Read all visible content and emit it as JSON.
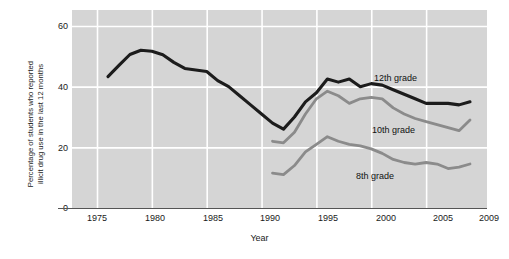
{
  "chart_data": {
    "type": "line",
    "title": "",
    "xlabel": "Year",
    "ylabel_line1": "Percentage of students who reported",
    "ylabel_line2": "illicit drug use in the last 12 months",
    "xlim": [
      1974,
      2010
    ],
    "ylim": [
      0,
      64
    ],
    "grid": true,
    "legend_position": "inline-annotations",
    "xticks": [
      1975,
      1980,
      1985,
      1990,
      1995,
      2000,
      2005,
      2009
    ],
    "xtick_labels": [
      "1975",
      "1980",
      "1985",
      "1990",
      "1995",
      "2000",
      "2005",
      "2009"
    ],
    "yticks": [
      0,
      20,
      40,
      60
    ],
    "ytick_labels": [
      "0",
      "20",
      "40",
      "60"
    ],
    "plot_background": "#d5d5d5",
    "gridline_color": "#ffffff",
    "series": [
      {
        "name": "12th grade",
        "label": "12th grade",
        "color": "#1c1c1c",
        "x": [
          1976,
          1977,
          1978,
          1979,
          1980,
          1981,
          1982,
          1983,
          1984,
          1985,
          1986,
          1987,
          1988,
          1989,
          1990,
          1991,
          1992,
          1993,
          1994,
          1995,
          1996,
          1997,
          1998,
          1999,
          2000,
          2001,
          2002,
          2003,
          2004,
          2005,
          2006,
          2007,
          2008,
          2009
        ],
        "values": [
          43.3,
          47.0,
          50.6,
          52.0,
          51.7,
          50.5,
          48.0,
          46.0,
          45.5,
          45.0,
          42.0,
          40.0,
          37.0,
          34.0,
          31.0,
          28.0,
          26.0,
          30.0,
          35.0,
          38.0,
          42.5,
          41.5,
          42.5,
          40.0,
          41.0,
          40.5,
          39.0,
          37.5,
          36.0,
          34.5,
          34.5,
          34.5,
          34.0,
          35.0
        ],
        "style": "thick-dark"
      },
      {
        "name": "10th grade",
        "label": "10th grade",
        "color": "#8b8b8b",
        "x": [
          1991,
          1992,
          1993,
          1994,
          1995,
          1996,
          1997,
          1998,
          1999,
          2000,
          2001,
          2002,
          2003,
          2004,
          2005,
          2006,
          2007,
          2008,
          2009
        ],
        "values": [
          22.0,
          21.5,
          25.0,
          31.0,
          36.0,
          38.5,
          37.0,
          34.5,
          36.0,
          36.5,
          36.0,
          33.0,
          31.0,
          29.5,
          28.5,
          27.5,
          26.5,
          25.5,
          29.0
        ],
        "style": "thick-gray"
      },
      {
        "name": "8th grade",
        "label": "8th grade",
        "color": "#8b8b8b",
        "x": [
          1991,
          1992,
          1993,
          1994,
          1995,
          1996,
          1997,
          1998,
          1999,
          2000,
          2001,
          2002,
          2003,
          2004,
          2005,
          2006,
          2007,
          2008,
          2009
        ],
        "values": [
          11.5,
          11.0,
          14.0,
          18.5,
          21.0,
          23.5,
          22.0,
          21.0,
          20.5,
          19.5,
          18.0,
          16.0,
          15.0,
          14.5,
          15.0,
          14.5,
          13.0,
          13.5,
          14.5
        ],
        "style": "thick-gray"
      }
    ],
    "annotations": [
      {
        "text": "12th grade",
        "x_px": 374,
        "y_px": 73
      },
      {
        "text": "10th grade",
        "x_px": 372,
        "y_px": 125
      },
      {
        "text": "8th grade",
        "x_px": 356,
        "y_px": 171
      }
    ]
  }
}
